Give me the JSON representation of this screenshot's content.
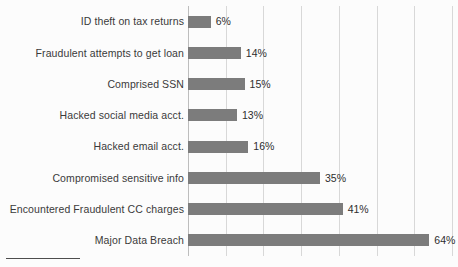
{
  "chart_data": {
    "type": "bar",
    "orientation": "horizontal",
    "title": "",
    "subtitle": "",
    "xlabel": "",
    "ylabel": "",
    "xlim": [
      0,
      70
    ],
    "grid": true,
    "grid_axis": "x",
    "gridline_interval": 10,
    "gridline_values": [
      0,
      10,
      20,
      30,
      40,
      50,
      60,
      70
    ],
    "legend": false,
    "legend_position": "none",
    "value_suffix": "%",
    "bar_color": "#7c7c7c",
    "background_color": "#fcfcfc",
    "gridline_color": "#d8d8d8",
    "categories": [
      "ID theft on tax returns",
      "Fraudulent attempts to get loan",
      "Comprised SSN",
      "Hacked social media acct.",
      "Hacked email acct.",
      "Compromised sensitive info",
      "Encountered Fraudulent CC charges",
      "Major Data Breach"
    ],
    "values": [
      6,
      14,
      15,
      13,
      16,
      35,
      41,
      64
    ],
    "data_labels": [
      "6%",
      "14%",
      "15%",
      "13%",
      "16%",
      "35%",
      "41%",
      "64%"
    ]
  }
}
